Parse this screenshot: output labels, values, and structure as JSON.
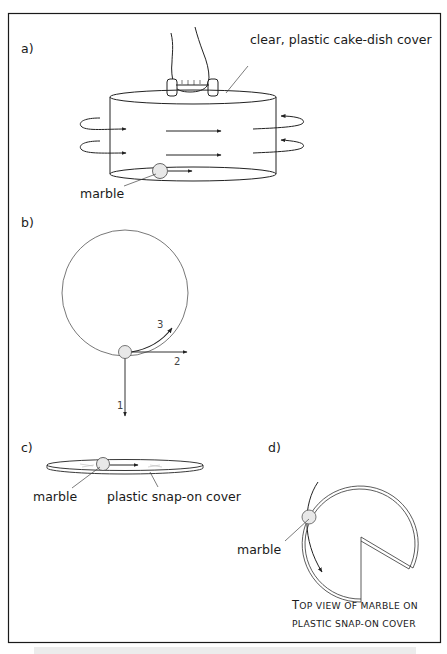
{
  "figure": {
    "panels": [
      {
        "id": "a",
        "label": "a)",
        "annotations": {
          "cover": "clear, plastic cake-dish cover",
          "marble": "marble"
        }
      },
      {
        "id": "b",
        "label": "b)",
        "arrows": [
          {
            "label": "1"
          },
          {
            "label": "2"
          },
          {
            "label": "3"
          }
        ]
      },
      {
        "id": "c",
        "label": "c)",
        "annotations": {
          "marble": "marble",
          "cover": "plastic snap-on cover"
        }
      },
      {
        "id": "d",
        "label": "d)",
        "annotations": {
          "marble": "marble"
        },
        "caption": {
          "line1_initial": "T",
          "line1_rest": "OP VIEW OF MARBLE ON",
          "line2": "PLASTIC SNAP-ON COVER"
        }
      }
    ]
  },
  "colors": {
    "frame": "#1a1a1a",
    "line": "#222222",
    "thin_line": "#555555",
    "marble_fill": "#e8e8e8",
    "strip": "#ececec"
  }
}
